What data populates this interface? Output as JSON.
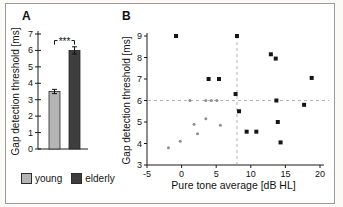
{
  "figure": {
    "panel_a": {
      "label": "A"
    },
    "panel_b": {
      "label": "B"
    },
    "legend": [
      {
        "label": "young"
      },
      {
        "label": "elderly"
      }
    ]
  },
  "chart_data": [
    {
      "type": "bar",
      "panel": "A",
      "categories": [
        "young",
        "elderly"
      ],
      "values": [
        3.5,
        6.0
      ],
      "errors": [
        0.13,
        0.22
      ],
      "ylabel": "Gap detection threshold [ms]",
      "ylim": [
        0,
        7
      ],
      "yticks": [
        0,
        1,
        2,
        3,
        4,
        5,
        6,
        7
      ],
      "significance_label": "***",
      "bar_colors": [
        "#b4b4b4",
        "#3e3e3e"
      ],
      "grid": false,
      "legend_position": "below"
    },
    {
      "type": "scatter",
      "panel": "B",
      "xlabel": "Pure tone average [dB HL]",
      "ylabel": "Gap detection threshold [ms]",
      "xlim": [
        -5,
        20
      ],
      "ylim": [
        3,
        9
      ],
      "xticks": [
        -5,
        0,
        5,
        10,
        15,
        20
      ],
      "yticks": [
        3,
        4,
        5,
        6,
        7,
        8,
        9
      ],
      "reference_lines": {
        "y": 6,
        "x": 8,
        "style": "dashed",
        "color": "#b3b3b3"
      },
      "series": [
        {
          "name": "young",
          "marker": "circle",
          "color": "#8e8e8e",
          "points": [
            [
              -1.9,
              3.8
            ],
            [
              -0.2,
              4.1
            ],
            [
              1.8,
              4.9
            ],
            [
              2.3,
              4.45
            ],
            [
              3.5,
              5.15
            ],
            [
              5.6,
              4.85
            ],
            [
              1.2,
              6.0
            ],
            [
              3.5,
              6.0
            ],
            [
              4.3,
              6.0
            ],
            [
              5.1,
              6.0
            ]
          ]
        },
        {
          "name": "elderly",
          "marker": "square",
          "color": "#151515",
          "points": [
            [
              -0.8,
              9.0
            ],
            [
              8,
              9.0
            ],
            [
              12.9,
              8.15
            ],
            [
              13.6,
              7.95
            ],
            [
              3.9,
              7.0
            ],
            [
              5.4,
              7.0
            ],
            [
              18.8,
              7.05
            ],
            [
              7.8,
              6.3
            ],
            [
              13.7,
              6.0
            ],
            [
              17.7,
              5.8
            ],
            [
              8.3,
              5.5
            ],
            [
              13.9,
              5.0
            ],
            [
              9.4,
              4.55
            ],
            [
              10.8,
              4.55
            ],
            [
              14.3,
              4.05
            ]
          ]
        }
      ]
    }
  ]
}
